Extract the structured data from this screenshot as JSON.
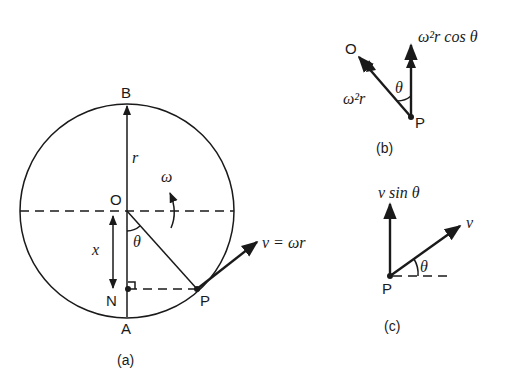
{
  "figure": {
    "panel_a": {
      "caption": "(a)",
      "points": {
        "B": "B",
        "O": "O",
        "N": "N",
        "A": "A",
        "P": "P"
      },
      "labels": {
        "radius": "r",
        "angular_velocity": "ω",
        "angle": "θ",
        "displacement": "x",
        "velocity": "v = ωr"
      }
    },
    "panel_b": {
      "caption": "(b)",
      "points": {
        "O": "O",
        "P": "P"
      },
      "labels": {
        "centripetal": "ω²r",
        "component": "ω²r cos θ",
        "angle": "θ"
      }
    },
    "panel_c": {
      "caption": "(c)",
      "points": {
        "P": "P"
      },
      "labels": {
        "velocity": "v",
        "component": "v sin θ",
        "angle": "θ"
      }
    }
  }
}
